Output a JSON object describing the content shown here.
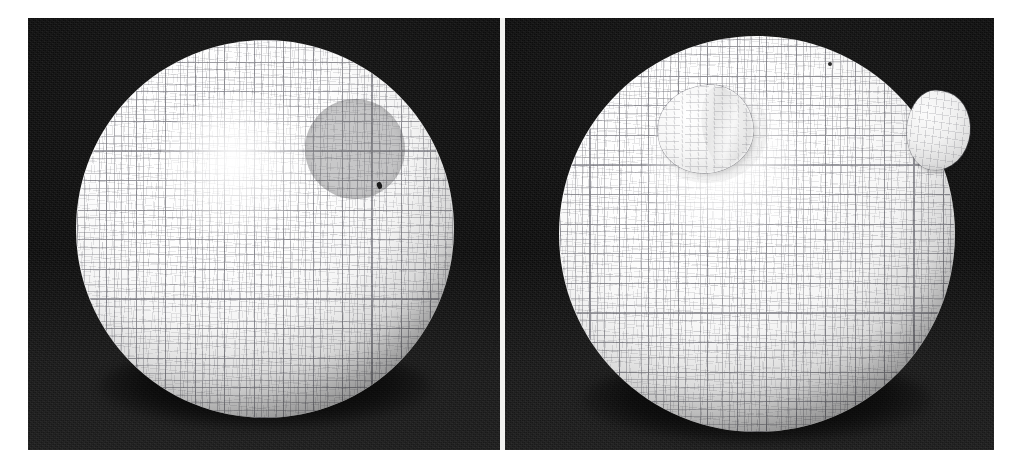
{
  "figure": {
    "background_color": "#ffffff",
    "panel_background_color": "#0b0b0b",
    "mesh_line_color": "#46464e",
    "surface_color": "#ffffff",
    "width_px": 1026,
    "height_px": 473
  },
  "panels": [
    {
      "id": "left",
      "caption": "",
      "label": "",
      "scene_background": "#0b0b0b",
      "sphere": {
        "name": "undeformed-mesh-sphere",
        "surface": "smooth",
        "mesh_type": "quadrilateral lat-lon grid",
        "shading": "diffuse with limb darkening"
      },
      "annotations": [
        {
          "name": "grey-circular-patch",
          "kind": "flat shaded disc region",
          "color": "#606064",
          "location": "upper right of sphere"
        },
        {
          "name": "dark-speck",
          "kind": "small dark marker",
          "color": "#1a1a1a",
          "location": "right of grey patch"
        }
      ]
    },
    {
      "id": "right",
      "caption": "",
      "label": "",
      "scene_background": "#0b0b0b",
      "sphere": {
        "name": "deformed-mesh-sphere",
        "surface": "deformed with protrusions",
        "mesh_type": "quadrilateral lat-lon grid",
        "shading": "diffuse with limb darkening"
      },
      "annotations": [
        {
          "name": "upper-left-protrusion",
          "kind": "extruded bump / blister",
          "color": "#f6f6f6",
          "location": "upper left quadrant of sphere"
        },
        {
          "name": "right-edge-protrusion",
          "kind": "extruded bump breaking the silhouette",
          "color": "#f0f0f0",
          "location": "right limb of sphere"
        },
        {
          "name": "dark-speck",
          "kind": "small dark marker",
          "color": "#2a2a2a",
          "location": "near top of sphere"
        }
      ]
    }
  ],
  "chart_data": {
    "type": "scatter",
    "title": "",
    "xlabel": "",
    "ylabel": "",
    "note": "Rendered 3D geometry, not a plotted data chart."
  }
}
